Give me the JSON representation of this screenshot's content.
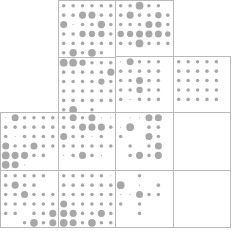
{
  "figure": {
    "width": 231,
    "height": 231,
    "background_color": "#ffffff",
    "dot_color": "#a8a8a8",
    "border_color": "#b9b9b9",
    "panel_size": 57.5,
    "grid_rows": 6,
    "grid_cols": 6,
    "max_radius": 4.6,
    "blocks": [
      {
        "name": "block-top-left",
        "x": 58.0,
        "y": 0.0,
        "w": 115.0,
        "h": 115.0
      },
      {
        "name": "block-top-right",
        "x": 115.5,
        "y": 56.5,
        "w": 115.0,
        "h": 115.0
      },
      {
        "name": "block-bottom-left",
        "x": 0.5,
        "y": 112.5,
        "w": 115.0,
        "h": 115.0
      },
      {
        "name": "block-bottom-right",
        "x": 115.5,
        "y": 112.5,
        "w": 115.0,
        "h": 115.0
      }
    ]
  },
  "chart_data": {
    "type": "heatmap",
    "xlabel": "",
    "ylabel": "",
    "legend": [],
    "grid": true,
    "value_encoding": "dot radius proportional to magnitude (0 = absent, 1 = max)",
    "panels": [
      {
        "name": "panel-A1",
        "block": "block-top-left",
        "row": 0,
        "col": 0,
        "values": [
          [
            0.4,
            0.4,
            0.4,
            0.4,
            0.4,
            0.4
          ],
          [
            0.4,
            0.4,
            0.78,
            0.78,
            0.4,
            0.4
          ],
          [
            0.78,
            0.12,
            0.4,
            0.4,
            0.82,
            0.4
          ],
          [
            0.4,
            0.4,
            0.7,
            0.7,
            0.7,
            0.4
          ],
          [
            0.4,
            0.4,
            0.4,
            0.4,
            0.4,
            0.4
          ],
          [
            0.4,
            0.82,
            0.4,
            0.86,
            0.4,
            0.0
          ]
        ]
      },
      {
        "name": "panel-A2",
        "block": "block-top-left",
        "row": 0,
        "col": 1,
        "values": [
          [
            0.4,
            0.4,
            0.86,
            0.4,
            0.4,
            0.0
          ],
          [
            0.4,
            0.78,
            0.4,
            0.4,
            0.7,
            0.4
          ],
          [
            0.4,
            0.4,
            0.4,
            0.78,
            0.7,
            0.4
          ],
          [
            0.7,
            0.7,
            0.78,
            0.78,
            0.78,
            0.62
          ],
          [
            0.4,
            0.4,
            0.86,
            0.4,
            0.4,
            0.4
          ],
          [
            0.0,
            0.0,
            0.0,
            0.0,
            0.0,
            0.0
          ]
        ]
      },
      {
        "name": "panel-A3",
        "block": "block-top-left",
        "row": 1,
        "col": 0,
        "values": [
          [
            0.86,
            0.86,
            0.7,
            0.4,
            0.4,
            0.4
          ],
          [
            0.4,
            0.4,
            0.4,
            0.4,
            0.4,
            0.78
          ],
          [
            0.4,
            0.4,
            0.4,
            0.4,
            0.7,
            0.4
          ],
          [
            0.4,
            0.4,
            0.4,
            0.4,
            0.4,
            0.4
          ],
          [
            0.4,
            0.4,
            0.4,
            0.4,
            0.4,
            0.4
          ],
          [
            0.4,
            0.86,
            0.0,
            0.4,
            0.0,
            0.0
          ]
        ]
      },
      {
        "name": "panel-A4",
        "block": "block-top-left",
        "row": 1,
        "col": 1,
        "values": [
          [
            0.0,
            0.4,
            0.4,
            0.78,
            0.86,
            0.4
          ],
          [
            0.12,
            0.4,
            0.4,
            0.86,
            0.4,
            0.4
          ],
          [
            0.4,
            0.4,
            0.4,
            0.78,
            0.4,
            0.4
          ],
          [
            0.12,
            0.4,
            0.4,
            0.4,
            0.4,
            0.4
          ],
          [
            0.4,
            0.4,
            0.86,
            0.86,
            0.86,
            0.4
          ],
          [
            0.0,
            0.0,
            0.0,
            0.0,
            0.0,
            0.0
          ]
        ]
      },
      {
        "name": "panel-B1",
        "block": "block-top-right",
        "row": 0,
        "col": 0,
        "values": [
          [
            0.12,
            0.78,
            0.4,
            0.4,
            0.4,
            0.0
          ],
          [
            0.4,
            0.4,
            0.4,
            0.4,
            0.4,
            0.0
          ],
          [
            0.4,
            0.4,
            0.78,
            0.4,
            0.4,
            0.0
          ],
          [
            0.4,
            0.4,
            0.7,
            0.4,
            0.4,
            0.0
          ],
          [
            0.4,
            0.12,
            0.4,
            0.4,
            0.4,
            0.0
          ],
          [
            0.0,
            0.0,
            0.0,
            0.0,
            0.0,
            0.0
          ]
        ]
      },
      {
        "name": "panel-B2",
        "block": "block-top-right",
        "row": 0,
        "col": 1,
        "values": [
          [
            0.4,
            0.4,
            0.4,
            0.4,
            0.4,
            0.0
          ],
          [
            0.4,
            0.4,
            0.4,
            0.4,
            0.4,
            0.0
          ],
          [
            0.4,
            0.4,
            0.4,
            0.4,
            0.4,
            0.0
          ],
          [
            0.4,
            0.4,
            0.4,
            0.4,
            0.4,
            0.0
          ],
          [
            0.4,
            0.4,
            0.4,
            0.4,
            0.4,
            0.0
          ],
          [
            0.0,
            0.0,
            0.0,
            0.0,
            0.0,
            0.0
          ]
        ]
      },
      {
        "name": "panel-B3",
        "block": "block-top-right",
        "row": 1,
        "col": 0,
        "values": [
          [
            0.4,
            0.4,
            0.4,
            0.78,
            0.4,
            0.4
          ],
          [
            0.4,
            0.4,
            0.4,
            0.78,
            0.4,
            0.4
          ],
          [
            0.4,
            0.4,
            0.4,
            0.4,
            0.4,
            0.4
          ],
          [
            0.4,
            0.4,
            0.4,
            0.4,
            0.4,
            0.4
          ],
          [
            0.4,
            0.4,
            0.4,
            0.4,
            0.4,
            0.4
          ],
          [
            0.4,
            0.4,
            0.4,
            0.4,
            0.4,
            0.4
          ]
        ]
      },
      {
        "name": "panel-B4",
        "block": "block-top-right",
        "row": 1,
        "col": 1,
        "values": [
          [
            0.78,
            0.4,
            0.4,
            0.4,
            0.4,
            0.78
          ],
          [
            0.78,
            0.4,
            0.78,
            0.4,
            0.4,
            0.78
          ],
          [
            0.4,
            0.4,
            0.4,
            0.4,
            0.4,
            0.78
          ],
          [
            0.4,
            0.4,
            0.4,
            0.0,
            0.4,
            0.4
          ],
          [
            0.78,
            0.4,
            0.4,
            0.0,
            0.4,
            0.4
          ],
          [
            0.4,
            0.0,
            0.0,
            0.0,
            0.0,
            0.4
          ]
        ]
      },
      {
        "name": "panel-C1",
        "block": "block-bottom-left",
        "row": 0,
        "col": 0,
        "values": [
          [
            0.12,
            0.78,
            0.4,
            0.4,
            0.4,
            0.4
          ],
          [
            0.4,
            0.4,
            0.4,
            0.4,
            0.4,
            0.4
          ],
          [
            0.4,
            0.12,
            0.4,
            0.4,
            0.4,
            0.4
          ],
          [
            0.78,
            0.4,
            0.4,
            0.78,
            0.4,
            0.4
          ],
          [
            0.86,
            0.78,
            0.78,
            0.4,
            0.4,
            0.0
          ],
          [
            0.86,
            0.78,
            0.12,
            0.0,
            0.0,
            0.0
          ]
        ]
      },
      {
        "name": "panel-C2",
        "block": "block-bottom-left",
        "row": 0,
        "col": 1,
        "values": [
          [
            0.4,
            0.78,
            0.4,
            0.78,
            0.12,
            0.12
          ],
          [
            0.4,
            0.4,
            0.78,
            0.78,
            0.78,
            0.4
          ],
          [
            0.78,
            0.4,
            0.4,
            0.12,
            0.4,
            0.0
          ],
          [
            0.4,
            0.4,
            0.4,
            0.4,
            0.4,
            0.4
          ],
          [
            0.12,
            0.4,
            0.78,
            0.4,
            0.12,
            0.0
          ],
          [
            0.0,
            0.0,
            0.0,
            0.0,
            0.0,
            0.0
          ]
        ]
      },
      {
        "name": "panel-C3",
        "block": "block-bottom-left",
        "row": 1,
        "col": 0,
        "values": [
          [
            0.4,
            0.4,
            0.4,
            0.4,
            0.4,
            0.0
          ],
          [
            0.4,
            0.78,
            0.4,
            0.4,
            0.0,
            0.0
          ],
          [
            0.4,
            0.4,
            0.78,
            0.4,
            0.4,
            0.4
          ],
          [
            0.4,
            0.4,
            0.4,
            0.4,
            0.4,
            0.4
          ],
          [
            0.4,
            0.4,
            0.0,
            0.4,
            0.4,
            0.78
          ],
          [
            0.0,
            0.0,
            0.4,
            0.86,
            0.4,
            0.78
          ]
        ]
      },
      {
        "name": "panel-C4",
        "block": "block-bottom-left",
        "row": 1,
        "col": 1,
        "values": [
          [
            0.4,
            0.4,
            0.4,
            0.4,
            0.4,
            0.12
          ],
          [
            0.4,
            0.4,
            0.4,
            0.4,
            0.4,
            0.4
          ],
          [
            0.4,
            0.4,
            0.4,
            0.4,
            0.4,
            0.4
          ],
          [
            0.78,
            0.4,
            0.4,
            0.4,
            0.4,
            0.4
          ],
          [
            0.78,
            0.78,
            0.4,
            0.4,
            0.78,
            0.4
          ],
          [
            0.86,
            0.78,
            0.4,
            0.86,
            0.4,
            0.4
          ]
        ]
      },
      {
        "name": "panel-D1",
        "block": "block-bottom-right",
        "row": 0,
        "col": 0,
        "values": [
          [
            0.0,
            0.12,
            0.12,
            0.78,
            0.78,
            0.0
          ],
          [
            0.12,
            0.86,
            0.0,
            0.4,
            0.4,
            0.0
          ],
          [
            0.4,
            0.0,
            0.0,
            0.78,
            0.4,
            0.0
          ],
          [
            0.0,
            0.4,
            0.0,
            0.4,
            0.78,
            0.0
          ],
          [
            0.0,
            0.4,
            0.78,
            0.4,
            0.78,
            0.0
          ],
          [
            0.0,
            0.0,
            0.0,
            0.0,
            0.0,
            0.0
          ]
        ]
      },
      {
        "name": "panel-D2",
        "block": "block-bottom-right",
        "row": 0,
        "col": 1,
        "values": [
          [
            0.0,
            0.0,
            0.0,
            0.0,
            0.0,
            0.0
          ],
          [
            0.0,
            0.0,
            0.0,
            0.0,
            0.0,
            0.0
          ],
          [
            0.0,
            0.0,
            0.0,
            0.0,
            0.0,
            0.0
          ],
          [
            0.0,
            0.0,
            0.0,
            0.0,
            0.0,
            0.0
          ],
          [
            0.0,
            0.0,
            0.0,
            0.0,
            0.0,
            0.0
          ],
          [
            0.0,
            0.0,
            0.0,
            0.0,
            0.0,
            0.0
          ]
        ]
      },
      {
        "name": "panel-D3",
        "block": "block-bottom-right",
        "row": 1,
        "col": 0,
        "values": [
          [
            0.0,
            0.0,
            0.4,
            0.0,
            0.0,
            0.0
          ],
          [
            0.86,
            0.0,
            0.12,
            0.0,
            0.4,
            0.0
          ],
          [
            0.12,
            0.12,
            0.78,
            0.4,
            0.4,
            0.0
          ],
          [
            0.4,
            0.0,
            0.4,
            0.0,
            0.0,
            0.0
          ],
          [
            0.0,
            0.0,
            0.4,
            0.0,
            0.0,
            0.0
          ],
          [
            0.0,
            0.0,
            0.0,
            0.0,
            0.0,
            0.0
          ]
        ]
      },
      {
        "name": "panel-D4",
        "block": "block-bottom-right",
        "row": 1,
        "col": 1,
        "values": [
          [
            0.0,
            0.0,
            0.0,
            0.0,
            0.0,
            0.0
          ],
          [
            0.0,
            0.0,
            0.0,
            0.0,
            0.0,
            0.0
          ],
          [
            0.0,
            0.0,
            0.0,
            0.0,
            0.0,
            0.0
          ],
          [
            0.0,
            0.0,
            0.0,
            0.0,
            0.0,
            0.0
          ],
          [
            0.0,
            0.0,
            0.0,
            0.0,
            0.0,
            0.0
          ],
          [
            0.0,
            0.0,
            0.0,
            0.0,
            0.0,
            0.0
          ]
        ]
      }
    ]
  }
}
